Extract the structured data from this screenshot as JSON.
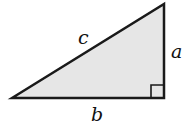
{
  "diagram": {
    "type": "right-triangle",
    "fill_color": "#e6e6e6",
    "stroke_color": "#1a1a1a",
    "labels": {
      "hypotenuse": "c",
      "vertical_leg": "a",
      "horizontal_leg": "b"
    },
    "right_angle_marker": true
  }
}
